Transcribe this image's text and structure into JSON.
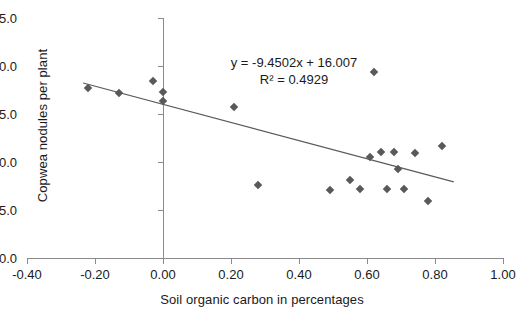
{
  "chart_data": {
    "type": "scatter",
    "title": "",
    "xlabel": "Soil organic carbon in percentages",
    "ylabel": "Copwea nodules per plant",
    "xlim": [
      -0.4,
      1.0
    ],
    "ylim": [
      0.0,
      25.0
    ],
    "xticks": [
      "-0.40",
      "-0.20",
      "0.00",
      "0.20",
      "0.40",
      "0.60",
      "0.80",
      "1.00"
    ],
    "xtick_values": [
      -0.4,
      -0.2,
      0.0,
      0.2,
      0.4,
      0.6,
      0.8,
      1.0
    ],
    "yticks": [
      "0.0",
      "5.0",
      "10.0",
      "15.0",
      "20.0",
      "25.0"
    ],
    "ytick_values": [
      0.0,
      5.0,
      10.0,
      15.0,
      20.0,
      25.0
    ],
    "grid": false,
    "legend": "none",
    "marker_shape": "diamond",
    "marker_color": "#595959",
    "trendline_color": "#595959",
    "points": [
      {
        "x": -0.22,
        "y": 17.7
      },
      {
        "x": -0.13,
        "y": 17.2
      },
      {
        "x": -0.03,
        "y": 18.4
      },
      {
        "x": 0.0,
        "y": 17.3
      },
      {
        "x": 0.0,
        "y": 16.4
      },
      {
        "x": 0.21,
        "y": 15.7
      },
      {
        "x": 0.28,
        "y": 7.6
      },
      {
        "x": 0.49,
        "y": 7.1
      },
      {
        "x": 0.55,
        "y": 8.1
      },
      {
        "x": 0.58,
        "y": 7.2
      },
      {
        "x": 0.61,
        "y": 10.5
      },
      {
        "x": 0.62,
        "y": 19.4
      },
      {
        "x": 0.64,
        "y": 11.0
      },
      {
        "x": 0.66,
        "y": 7.2
      },
      {
        "x": 0.68,
        "y": 11.0
      },
      {
        "x": 0.69,
        "y": 9.3
      },
      {
        "x": 0.71,
        "y": 7.2
      },
      {
        "x": 0.74,
        "y": 10.9
      },
      {
        "x": 0.78,
        "y": 5.9
      },
      {
        "x": 0.82,
        "y": 11.7
      }
    ],
    "trendline": {
      "slope": -9.4502,
      "intercept": 16.007,
      "r_squared": 0.4929,
      "x_start": -0.235,
      "x_end": 0.855
    },
    "annotations": {
      "equation": "y = -9.4502x + 16.007",
      "r_squared_text": "R² = 0.4929"
    }
  }
}
